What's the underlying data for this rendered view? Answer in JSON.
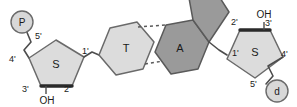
{
  "diagram": {
    "colors": {
      "stroke": "#4d4d4d",
      "light_fill": "#dcdcdc",
      "dark_fill": "#9a9a9a",
      "circle_fill": "#d8d8d8",
      "text": "#1a1a1a",
      "background": "#ffffff"
    },
    "left_strand": {
      "phosphate": {
        "glyph": "P",
        "name": "phosphate-group"
      },
      "sugar": {
        "glyph": "S",
        "name": "deoxyribose-sugar"
      },
      "base": {
        "glyph": "T",
        "name": "thymine-base"
      },
      "hydroxyl": "OH",
      "carbon_labels": [
        "5'",
        "4'",
        "3'",
        "2'",
        "1'"
      ]
    },
    "right_strand": {
      "phosphate": {
        "glyph": "d",
        "name": "phosphate-group-rotated"
      },
      "sugar": {
        "glyph": "S",
        "name": "deoxyribose-sugar"
      },
      "base": {
        "glyph": "A",
        "name": "adenine-base"
      },
      "hydroxyl": "OH",
      "carbon_labels": [
        "1'",
        "2'",
        "3'",
        "4'",
        "5'"
      ]
    },
    "hydrogen_bonds": {
      "count": 2,
      "style": "dashed"
    }
  }
}
